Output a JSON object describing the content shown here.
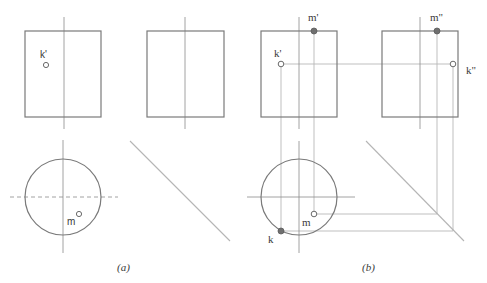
{
  "figure": {
    "panel_a": {
      "caption": "(a)",
      "front_view": {
        "label_k": "k'"
      },
      "top_view": {
        "label_m": "m"
      }
    },
    "panel_b": {
      "caption": "(b)",
      "front_view": {
        "label_k": "k'",
        "label_m": "m'"
      },
      "side_view": {
        "label_k": "k\"",
        "label_m": "m\""
      },
      "top_view": {
        "label_k": "k",
        "label_m": "m"
      }
    }
  },
  "colors": {
    "outline": "#7a7a7a",
    "projection": "#b8b8b8",
    "point_fill": "#6f6f6f",
    "background": "#ffffff"
  }
}
